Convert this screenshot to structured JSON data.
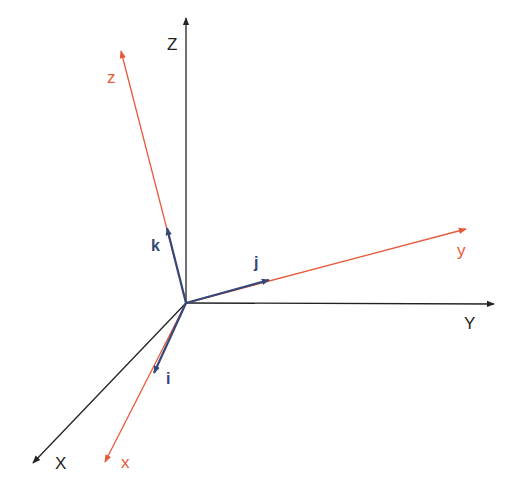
{
  "colors": {
    "world_axes": "#222222",
    "body_axes": "#e8583a",
    "unit_vectors": "#36477a",
    "background": "#ffffff"
  },
  "origin": [
    186,
    303
  ],
  "world_axes": [
    {
      "name": "X",
      "label": "X",
      "tip": [
        33,
        463
      ],
      "label_pos": [
        55,
        469
      ]
    },
    {
      "name": "Y",
      "label": "Y",
      "tip": [
        494,
        304
      ],
      "label_pos": [
        464,
        329
      ]
    },
    {
      "name": "Z",
      "label": "Z",
      "tip": [
        186,
        18
      ],
      "label_pos": [
        167,
        50
      ]
    }
  ],
  "body_axes": [
    {
      "name": "x",
      "label": "x",
      "tip": [
        105,
        462
      ],
      "label_pos": [
        121,
        468
      ]
    },
    {
      "name": "y",
      "label": "y",
      "tip": [
        466,
        229
      ],
      "label_pos": [
        457,
        256
      ]
    },
    {
      "name": "z",
      "label": "z",
      "tip": [
        121,
        51
      ],
      "label_pos": [
        107,
        83
      ]
    }
  ],
  "unit_vectors": [
    {
      "name": "i",
      "label": "i",
      "tip": [
        154,
        373
      ],
      "label_pos": [
        166,
        384
      ]
    },
    {
      "name": "j",
      "label": "j",
      "tip": [
        269,
        280
      ],
      "label_pos": [
        254,
        268
      ]
    },
    {
      "name": "k",
      "label": "k",
      "tip": [
        167,
        228
      ],
      "label_pos": [
        151,
        251
      ]
    }
  ]
}
